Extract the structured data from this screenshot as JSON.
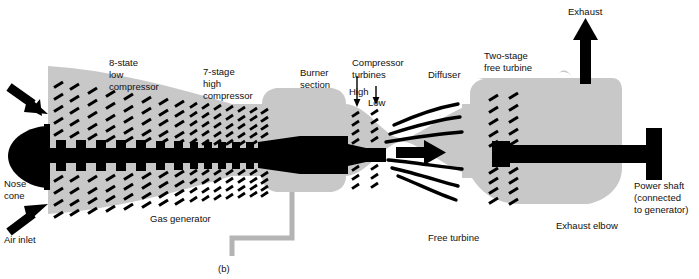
{
  "figure": {
    "caption": "(b)",
    "colors": {
      "body_gray": "#c8c8c8",
      "ink_black": "#000000",
      "background": "#ffffff",
      "pipe_gray": "#b4b4b4"
    }
  },
  "labels": {
    "low_compressor": {
      "line1": "8-state",
      "line2": "low",
      "line3": "compressor"
    },
    "high_compressor": {
      "line1": "7-stage",
      "line2": "high",
      "line3": "compressor"
    },
    "burner": {
      "line1": "Burner",
      "line2": "section"
    },
    "compressor_turbines": {
      "line1": "Compressor",
      "line2": "turbines"
    },
    "turbine_high": "High",
    "turbine_low": "Low",
    "diffuser": "Diffuser",
    "free_turbine_top": {
      "line1": "Two-stage",
      "line2": "free turbine"
    },
    "exhaust": "Exhaust",
    "nose_cone": {
      "line1": "Nose",
      "line2": "cone"
    },
    "air_inlet": "Air inlet",
    "gas_generator": "Gas generator",
    "free_turbine_bottom": "Free turbine",
    "exhaust_elbow": "Exhaust elbow",
    "power_shaft": {
      "line1": "Power shaft",
      "line2": "(connected",
      "line3": "to generator)"
    }
  },
  "arrows": {
    "inlet_upper": "air-inlet-arrow-upper",
    "inlet_lower": "air-inlet-arrow-lower",
    "exhaust_up": "exhaust-arrow",
    "flow_center": "combustion-flow-arrow",
    "pointer_high": "high-turbine-pointer",
    "pointer_low": "low-turbine-pointer"
  },
  "components": {
    "nose_cone": "nose-cone",
    "low_compressor_stages": 8,
    "high_compressor_stages": 7,
    "compressor_turbine_stages": 2,
    "free_turbine_stages": 2,
    "burner_section": "burner-section",
    "diffuser": "diffuser",
    "exhaust_elbow": "exhaust-elbow",
    "power_shaft": "power-shaft",
    "fuel_drain_pipe": "fuel-drain-pipe",
    "main_shaft": "main-rotor-shaft"
  }
}
